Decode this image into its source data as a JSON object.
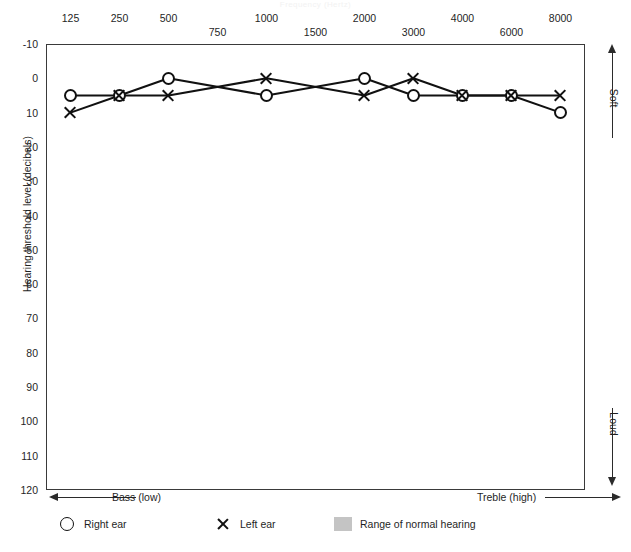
{
  "chart_data": {
    "type": "line",
    "xlabel": "Frequency (Hertz)",
    "ylabel": "Hearing threshold level (decibels)",
    "categories": [
      125,
      250,
      500,
      750,
      1000,
      1500,
      2000,
      3000,
      4000,
      6000,
      8000
    ],
    "x_tick_labels": [
      "125",
      "250",
      "500",
      "750",
      "1000",
      "1500",
      "2000",
      "3000",
      "4000",
      "6000",
      "8000"
    ],
    "x_tick_rows": [
      "top",
      "top",
      "top",
      "bottom",
      "top",
      "bottom",
      "top",
      "bottom",
      "top",
      "bottom",
      "top"
    ],
    "y_tick_labels": [
      "-10",
      "0",
      "10",
      "20",
      "30",
      "40",
      "50",
      "60",
      "70",
      "80",
      "90",
      "100",
      "110",
      "120"
    ],
    "y_tick_values": [
      -10,
      0,
      10,
      20,
      30,
      40,
      50,
      60,
      70,
      80,
      90,
      100,
      110,
      120
    ],
    "ylim": [
      -10,
      120
    ],
    "y_inverted": true,
    "grid": true,
    "legend_position": "bottom",
    "series": [
      {
        "name": "Right ear",
        "marker": "circle",
        "x": [
          125,
          250,
          500,
          1000,
          2000,
          3000,
          4000,
          6000,
          8000
        ],
        "values": [
          5,
          5,
          0,
          5,
          0,
          5,
          5,
          5,
          10
        ]
      },
      {
        "name": "Left ear",
        "marker": "x",
        "x": [
          125,
          250,
          500,
          1000,
          2000,
          3000,
          4000,
          6000,
          8000
        ],
        "values": [
          10,
          5,
          5,
          0,
          5,
          0,
          5,
          5,
          5
        ]
      }
    ],
    "shaded_region": {
      "label": "Range of normal hearing",
      "from": -10,
      "to": 15,
      "color": "#c4c4c4"
    },
    "annotations": {
      "bass": "Bass (low)",
      "treble": "Treble (high)",
      "soft": "Soft",
      "loud": "Loud"
    }
  },
  "legend": {
    "items": [
      {
        "label": "Right ear",
        "marker": "circle"
      },
      {
        "label": "Left ear",
        "marker": "x"
      },
      {
        "label": "Range of normal hearing",
        "marker": "swatch"
      }
    ]
  },
  "colors": {
    "ink": "#111111",
    "grid": "#6f6f6f",
    "band": "#c4c4c4",
    "frame": "#3a3a3a",
    "background": "#ffffff"
  }
}
